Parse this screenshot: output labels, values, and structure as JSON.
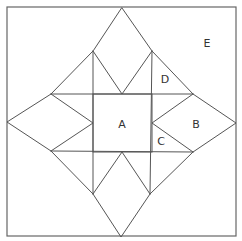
{
  "diagram": {
    "labels": [
      {
        "id": "A",
        "text": "A"
      },
      {
        "id": "B",
        "text": "B"
      },
      {
        "id": "C",
        "text": "C"
      },
      {
        "id": "D",
        "text": "D"
      },
      {
        "id": "E",
        "text": "E"
      }
    ],
    "colors": {
      "line": "#555555",
      "background": "#ffffff",
      "text": "#333333"
    }
  }
}
